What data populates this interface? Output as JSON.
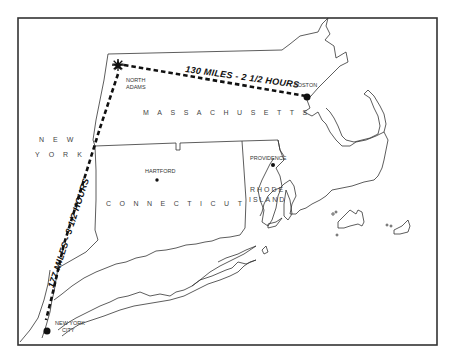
{
  "map": {
    "title": "",
    "colors": {
      "background": "#ffffff",
      "ink": "#111111",
      "frame": "#333333"
    },
    "routes": [
      {
        "id": "north-adams-boston",
        "label": "130 MILES - 2 1/2 HOURS",
        "from": "North Adams",
        "to": "Boston",
        "style": "dashed"
      },
      {
        "id": "north-adams-nyc",
        "label": "177 MILES - 3 1/2 HOURS",
        "from": "North Adams",
        "to": "New York City",
        "style": "dashed"
      }
    ],
    "states": {
      "massachusetts": "MASSACHUSETTS",
      "connecticut": "CONNECTICUT",
      "rhode_island_line1": "RHODE",
      "rhode_island_line2": "ISLAND",
      "new_york_line1": "NEW",
      "new_york_line2": "YORK"
    },
    "cities": {
      "north_adams_line1": "NORTH",
      "north_adams_line2": "ADAMS",
      "boston": "BOSTON",
      "hartford": "HARTFORD",
      "providence": "PROVIDENCE",
      "nyc_line1": "NEW YORK",
      "nyc_line2": "CITY"
    },
    "markers": {
      "north_adams": "star-icon",
      "boston": "dot-icon",
      "hartford": "dot-icon",
      "providence": "dot-icon",
      "new_york_city": "dot-icon"
    }
  }
}
